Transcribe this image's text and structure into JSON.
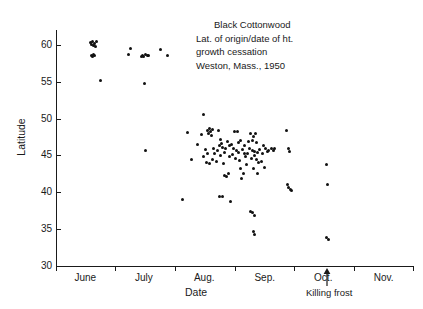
{
  "chart_data": {
    "type": "scatter",
    "title": "Black Cottonwood",
    "annotation_lines": [
      "Black Cottonwood",
      "Lat. of origin/date of ht.",
      "growth cessation",
      "Weston, Mass., 1950"
    ],
    "xlabel": "Date",
    "ylabel": "Latitude",
    "ylim": [
      30,
      62
    ],
    "yticks": [
      30,
      35,
      40,
      45,
      50,
      55,
      60
    ],
    "ytick_labels": [
      "30",
      "35",
      "40",
      "45",
      "50",
      "55",
      "60"
    ],
    "xlim": [
      0,
      183
    ],
    "x_axis_note": "x measured in days from June 1; month tick boundaries",
    "xtick_days": [
      0,
      30,
      61,
      92,
      122,
      153,
      183
    ],
    "xtick_month_labels": [
      "June",
      "July",
      "Aug.",
      "Sep.",
      "Oct.",
      "Nov."
    ],
    "xtick_month_centers_days": [
      15,
      45,
      76,
      107,
      137,
      168
    ],
    "grid": false,
    "legend": null,
    "marker": "filled-circle",
    "marker_color": "#111111",
    "annotations": [
      {
        "name": "killing-frost",
        "label": "Killing frost",
        "x_day": 139,
        "type": "up-arrow"
      }
    ],
    "n_points": 121,
    "points": [
      [
        17.5,
        60.3
      ],
      [
        18.8,
        60.5
      ],
      [
        19.6,
        60.2
      ],
      [
        20.8,
        60.4
      ],
      [
        19.2,
        59.9
      ],
      [
        18.2,
        60.0
      ],
      [
        20.2,
        59.8
      ],
      [
        18.0,
        58.6
      ],
      [
        19.0,
        58.7
      ],
      [
        18.6,
        58.4
      ],
      [
        19.8,
        58.5
      ],
      [
        23.0,
        55.1
      ],
      [
        38.0,
        59.5
      ],
      [
        37.0,
        58.7
      ],
      [
        44.5,
        58.6
      ],
      [
        46.0,
        58.7
      ],
      [
        45.0,
        58.4
      ],
      [
        46.8,
        58.5
      ],
      [
        44.0,
        58.4
      ],
      [
        47.5,
        58.6
      ],
      [
        53.5,
        59.3
      ],
      [
        57.0,
        58.5
      ],
      [
        45.5,
        54.7
      ],
      [
        45.8,
        45.6
      ],
      [
        67.5,
        48.1
      ],
      [
        65.0,
        39.0
      ],
      [
        69.5,
        44.5
      ],
      [
        72.5,
        46.5
      ],
      [
        74.5,
        47.8
      ],
      [
        75.5,
        50.5
      ],
      [
        77.5,
        48.4
      ],
      [
        78.5,
        48.6
      ],
      [
        79.2,
        48.3
      ],
      [
        80.0,
        48.5
      ],
      [
        78.0,
        47.9
      ],
      [
        79.8,
        47.7
      ],
      [
        76.5,
        45.8
      ],
      [
        77.5,
        45.3
      ],
      [
        75.5,
        44.8
      ],
      [
        77.0,
        44.0
      ],
      [
        78.5,
        43.9
      ],
      [
        80.5,
        46.0
      ],
      [
        81.5,
        45.2
      ],
      [
        80.2,
        44.4
      ],
      [
        83.5,
        48.4
      ],
      [
        84.5,
        47.2
      ],
      [
        85.0,
        46.6
      ],
      [
        84.0,
        46.4
      ],
      [
        85.5,
        46.1
      ],
      [
        83.0,
        45.6
      ],
      [
        84.5,
        45.0
      ],
      [
        82.5,
        44.2
      ],
      [
        86.0,
        43.9
      ],
      [
        86.5,
        42.3
      ],
      [
        87.5,
        42.2
      ],
      [
        88.5,
        42.5
      ],
      [
        84.0,
        39.4
      ],
      [
        85.2,
        39.4
      ],
      [
        89.5,
        38.8
      ],
      [
        91.5,
        48.3
      ],
      [
        93.0,
        48.3
      ],
      [
        91.0,
        45.9
      ],
      [
        92.5,
        45.6
      ],
      [
        93.5,
        45.4
      ],
      [
        90.5,
        45.1
      ],
      [
        92.0,
        44.6
      ],
      [
        94.0,
        44.3
      ],
      [
        95.5,
        45.8
      ],
      [
        96.5,
        45.3
      ],
      [
        94.5,
        43.2
      ],
      [
        96.0,
        42.6
      ],
      [
        97.5,
        43.8
      ],
      [
        95.0,
        41.9
      ],
      [
        99.5,
        48.0
      ],
      [
        101.0,
        47.6
      ],
      [
        102.5,
        47.9
      ],
      [
        100.5,
        47.0
      ],
      [
        103.0,
        46.8
      ],
      [
        99.0,
        45.9
      ],
      [
        100.8,
        45.7
      ],
      [
        102.0,
        45.5
      ],
      [
        103.5,
        45.4
      ],
      [
        101.5,
        45.0
      ],
      [
        100.0,
        44.6
      ],
      [
        102.8,
        44.4
      ],
      [
        104.0,
        44.0
      ],
      [
        101.0,
        43.2
      ],
      [
        103.2,
        42.6
      ],
      [
        99.8,
        37.4
      ],
      [
        100.5,
        37.3
      ],
      [
        101.5,
        36.9
      ],
      [
        101.0,
        34.7
      ],
      [
        102.0,
        34.3
      ],
      [
        106.5,
        46.3
      ],
      [
        107.5,
        45.9
      ],
      [
        108.5,
        45.5
      ],
      [
        106.0,
        45.2
      ],
      [
        109.0,
        45.6
      ],
      [
        107.0,
        43.3
      ],
      [
        110.5,
        45.9
      ],
      [
        111.5,
        45.6
      ],
      [
        112.0,
        46.0
      ],
      [
        118.0,
        48.4
      ],
      [
        119.0,
        45.9
      ],
      [
        119.5,
        45.5
      ],
      [
        118.5,
        41.0
      ],
      [
        119.2,
        40.6
      ],
      [
        120.0,
        40.4
      ],
      [
        120.8,
        40.3
      ],
      [
        138.5,
        43.8
      ],
      [
        139.0,
        41.0
      ],
      [
        138.8,
        33.9
      ],
      [
        139.5,
        33.6
      ],
      [
        88.0,
        46.9
      ],
      [
        89.0,
        46.3
      ],
      [
        87.0,
        45.9
      ],
      [
        86.2,
        45.4
      ],
      [
        88.8,
        44.9
      ],
      [
        90.0,
        46.5
      ],
      [
        93.8,
        46.7
      ],
      [
        94.8,
        47.0
      ],
      [
        96.8,
        46.4
      ],
      [
        98.0,
        45.2
      ],
      [
        97.0,
        44.9
      ],
      [
        98.5,
        46.9
      ],
      [
        104.5,
        45.8
      ],
      [
        105.5,
        44.2
      ]
    ]
  }
}
